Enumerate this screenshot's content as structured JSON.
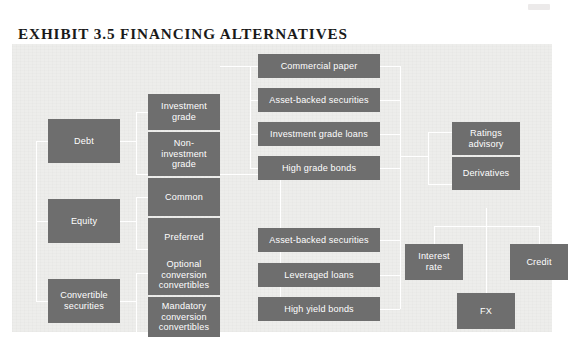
{
  "page": {
    "title": "EXHIBIT 3.5 FINANCING ALTERNATIVES",
    "node_fill": "#6e6e6e",
    "node_text": "#ffffff",
    "panel_background": "#ededeb",
    "connector_color": "#ffffff"
  },
  "diagram": {
    "type": "tree",
    "columns": {
      "level1": "Financing category",
      "level2": "Sub-category",
      "level3": "Instrument",
      "level4": "Advisory / derivative services"
    },
    "nodes": {
      "debt": "Debt",
      "equity": "Equity",
      "convertible_securities": "Convertible\nsecurities",
      "convertible_securities_l1": "Convertible",
      "convertible_securities_l2": "securities",
      "investment_grade_l1": "Investment",
      "investment_grade_l2": "grade",
      "non_investment_grade_l1": "Non-",
      "non_investment_grade_l2": "investment",
      "non_investment_grade_l3": "grade",
      "common": "Common",
      "preferred": "Preferred",
      "optional_conversion_l1": "Optional",
      "optional_conversion_l2": "conversion",
      "optional_conversion_l3": "convertibles",
      "mandatory_conversion_l1": "Mandatory",
      "mandatory_conversion_l2": "conversion",
      "mandatory_conversion_l3": "convertibles",
      "commercial_paper": "Commercial paper",
      "asset_backed_securities_top": "Asset-backed securities",
      "investment_grade_loans": "Investment grade loans",
      "high_grade_bonds": "High grade bonds",
      "asset_backed_securities_bottom": "Asset-backed securities",
      "leveraged_loans": "Leveraged loans",
      "high_yield_bonds": "High yield bonds",
      "ratings_advisory_l1": "Ratings",
      "ratings_advisory_l2": "advisory",
      "derivatives": "Derivatives",
      "interest_rate_l1": "Interest",
      "interest_rate_l2": "rate",
      "credit": "Credit",
      "fx": "FX"
    }
  }
}
